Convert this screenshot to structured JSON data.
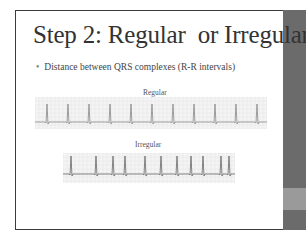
{
  "slide": {
    "title": "Step 2: Regular  or Irregular",
    "bullets": [
      "Distance between QRS complexes (R-R intervals)"
    ],
    "figures": [
      {
        "label": "Regular",
        "kind": "ecg-strip",
        "rhythm": "regular"
      },
      {
        "label": "Irregular",
        "kind": "ecg-strip",
        "rhythm": "irregular"
      }
    ],
    "accent_bar_color": "#6b6b6b",
    "accent_band_color": "#9a9a9a"
  }
}
